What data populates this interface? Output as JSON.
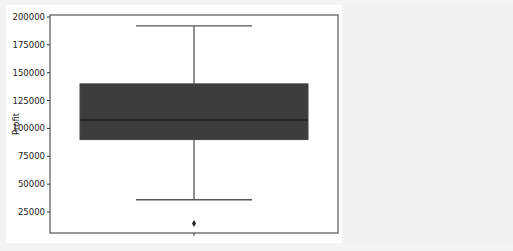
{
  "chart_data": {
    "type": "box",
    "title": "",
    "xlabel": "",
    "ylabel": "Profit",
    "ylim": [
      5000,
      202000
    ],
    "yticks": [
      25000,
      50000,
      75000,
      100000,
      125000,
      150000,
      175000,
      200000
    ],
    "ytick_labels": [
      "25000",
      "50000",
      "75000",
      "100000",
      "125000",
      "150000",
      "175000",
      "200000"
    ],
    "xticks": [
      ""
    ],
    "grid": false,
    "legend": null,
    "series": [
      {
        "name": "Profit",
        "whisker_low": 36000,
        "q1": 90000,
        "median": 107500,
        "q3": 140000,
        "whisker_high": 192000,
        "outliers": [
          14700
        ]
      }
    ],
    "colors": {
      "box_fill": "#3d3d3d",
      "median_line": "#1a1a1a",
      "whisker": "#555555",
      "axes": "#333333",
      "outlier": "#222222"
    }
  }
}
